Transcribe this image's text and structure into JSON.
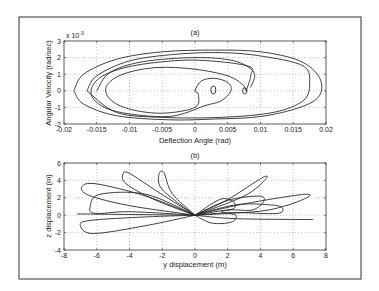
{
  "figure": {
    "frame": {
      "x": 19,
      "y": 17,
      "w": 342,
      "h": 262
    }
  },
  "chart_data": [
    {
      "type": "line",
      "title": "(a)",
      "xlabel": "Deflection Angle (rad)",
      "ylabel": "Angular Velocity (rad/sec)",
      "y_multiplier": "x 10",
      "y_exponent": "-3",
      "xlim": [
        -0.02,
        0.02
      ],
      "ylim": [
        -2,
        3
      ],
      "grid": true,
      "x_ticks": [
        "-0.02",
        "-0.015",
        "-0.01",
        "-0.005",
        "0",
        "0.005",
        "0.01",
        "0.015",
        "0.02"
      ],
      "y_ticks": [
        "3",
        "2",
        "1",
        "0",
        "-1",
        "-2"
      ],
      "description": "Phase portrait spiral: nested elliptical loops starting at small inner loops near (0,0), (0.0028,0), (0.0078,0) and expanding outward to about ±0.019 rad and +2.5/-1.8 x1e-3 rad/sec",
      "series": [
        {
          "name": "trajectory",
          "points": [
            [
              0.0078,
              0
            ],
            [
              0.0072,
              0.4
            ],
            [
              0.005,
              0.9
            ],
            [
              0.0,
              1.3
            ],
            [
              -0.006,
              1.4
            ],
            [
              -0.011,
              1.0
            ],
            [
              -0.0135,
              0.3
            ],
            [
              -0.013,
              -0.5
            ],
            [
              -0.01,
              -1.1
            ],
            [
              -0.005,
              -1.35
            ],
            [
              0.0,
              -1.0
            ],
            [
              0.0005,
              -0.2
            ],
            [
              0.0,
              0
            ],
            [
              0.001,
              0.6
            ],
            [
              0.003,
              0.75
            ],
            [
              0.005,
              0.5
            ],
            [
              0.0055,
              0
            ],
            [
              0.004,
              -0.6
            ],
            [
              0.0015,
              -0.9
            ],
            [
              -0.004,
              -1.55
            ],
            [
              -0.012,
              -1.25
            ],
            [
              -0.0155,
              -0.5
            ],
            [
              -0.0155,
              0.4
            ],
            [
              -0.013,
              1.1
            ],
            [
              -0.008,
              1.6
            ],
            [
              0.0,
              1.85
            ],
            [
              0.008,
              1.5
            ],
            [
              0.0085,
              0.9
            ],
            [
              0.0078,
              0
            ]
          ]
        },
        {
          "name": "outer",
          "points": [
            [
              -0.0185,
              0
            ],
            [
              -0.017,
              1.0
            ],
            [
              -0.012,
              1.9
            ],
            [
              -0.005,
              2.35
            ],
            [
              0.003,
              2.45
            ],
            [
              0.01,
              2.35
            ],
            [
              0.016,
              1.8
            ],
            [
              0.019,
              0.8
            ],
            [
              0.019,
              -0.3
            ],
            [
              0.016,
              -1.0
            ],
            [
              0.01,
              -1.55
            ],
            [
              0.003,
              -1.7
            ],
            [
              -0.004,
              -1.75
            ],
            [
              -0.012,
              -1.5
            ],
            [
              -0.017,
              -0.8
            ],
            [
              -0.0185,
              0
            ]
          ]
        }
      ]
    },
    {
      "type": "line",
      "title": "(b)",
      "xlabel": "y displacement (m)",
      "ylabel": "z displacement (m)",
      "xlim": [
        -8,
        8
      ],
      "ylim": [
        -4,
        6
      ],
      "grid": true,
      "x_ticks": [
        "-8",
        "-6",
        "-4",
        "-2",
        "0",
        "2",
        "4",
        "6",
        "8"
      ],
      "y_ticks": [
        "6",
        "4",
        "2",
        "0",
        "-2",
        "-4"
      ],
      "description": "Petal-shaped loops radiating from origin: left petals reaching (-7,3.5),(-4.2,4.9),(-1.9,5),(-6.4,2.5),(-7,-1),(-6.5,-2); right petals reaching (4.2,4.2),(6.7,2.4),(5.3,1),(3.9,2.2),(2,1.7); near-horizontal strokes to (-7.2,0.1) and (7.2,-0.5)",
      "series": [
        {
          "name": "petal_upper_left_1",
          "points": [
            [
              0,
              0
            ],
            [
              -3,
              2.2
            ],
            [
              -6,
              3.6
            ],
            [
              -6.9,
              3.3
            ],
            [
              -6.5,
              2.3
            ],
            [
              -4,
              1.1
            ],
            [
              0,
              0
            ]
          ]
        },
        {
          "name": "petal_upper_left_2",
          "points": [
            [
              0,
              0
            ],
            [
              -2.2,
              2.6
            ],
            [
              -4,
              4.8
            ],
            [
              -4.4,
              4.7
            ],
            [
              -4.2,
              3.6
            ],
            [
              -2.5,
              1.8
            ],
            [
              0,
              0
            ]
          ]
        },
        {
          "name": "petal_upper_left_3",
          "points": [
            [
              0,
              0
            ],
            [
              -1.4,
              2.5
            ],
            [
              -1.9,
              4.9
            ],
            [
              -2.2,
              4.7
            ],
            [
              -2.1,
              3.2
            ],
            [
              -1.1,
              1.5
            ],
            [
              0,
              0
            ]
          ]
        },
        {
          "name": "petal_mid_left",
          "points": [
            [
              0,
              0
            ],
            [
              -3,
              2.4
            ],
            [
              -5.8,
              2.4
            ],
            [
              -6.4,
              1.0
            ],
            [
              -6.1,
              0.2
            ],
            [
              -4,
              0.4
            ],
            [
              0,
              0
            ]
          ]
        },
        {
          "name": "petal_lower_left",
          "points": [
            [
              0,
              0
            ],
            [
              -3,
              -1.2
            ],
            [
              -6.2,
              -2.1
            ],
            [
              -7.0,
              -1.2
            ],
            [
              -6.4,
              -0.6
            ],
            [
              -3,
              -0.2
            ],
            [
              0,
              0
            ]
          ]
        },
        {
          "name": "line_left",
          "points": [
            [
              0,
              0
            ],
            [
              -7.2,
              0.15
            ]
          ]
        },
        {
          "name": "petal_upper_right_1",
          "points": [
            [
              0,
              0
            ],
            [
              2,
              1.8
            ],
            [
              4.1,
              4.3
            ],
            [
              4.3,
              4.1
            ],
            [
              3,
              2.2
            ],
            [
              0,
              0
            ]
          ]
        },
        {
          "name": "petal_right_big",
          "points": [
            [
              0,
              0
            ],
            [
              3,
              1.3
            ],
            [
              6.7,
              2.4
            ],
            [
              6.6,
              1.8
            ],
            [
              4.5,
              0.6
            ],
            [
              2,
              0.2
            ],
            [
              0,
              0
            ]
          ]
        },
        {
          "name": "petal_right_mid",
          "points": [
            [
              0,
              0
            ],
            [
              2.5,
              1.2
            ],
            [
              4.5,
              1.2
            ],
            [
              5.3,
              0.9
            ],
            [
              5,
              0.2
            ],
            [
              2.3,
              0.3
            ],
            [
              0,
              0
            ]
          ]
        },
        {
          "name": "petal_right_small",
          "points": [
            [
              0,
              0
            ],
            [
              2,
              1.7
            ],
            [
              3.9,
              2.2
            ],
            [
              4.2,
              1.6
            ],
            [
              3.5,
              0.6
            ],
            [
              2,
              0.6
            ],
            [
              0,
              0
            ]
          ]
        },
        {
          "name": "loop_near_2",
          "points": [
            [
              0,
              0
            ],
            [
              1.5,
              1.8
            ],
            [
              2.3,
              1.6
            ],
            [
              2.4,
              0.8
            ],
            [
              1.6,
              0.4
            ],
            [
              2.5,
              0
            ],
            [
              2.2,
              -0.8
            ],
            [
              1,
              -0.9
            ],
            [
              0,
              0
            ]
          ]
        },
        {
          "name": "line_right",
          "points": [
            [
              0,
              0
            ],
            [
              2.5,
              -0.4
            ],
            [
              7.2,
              -0.5
            ]
          ]
        }
      ]
    }
  ]
}
